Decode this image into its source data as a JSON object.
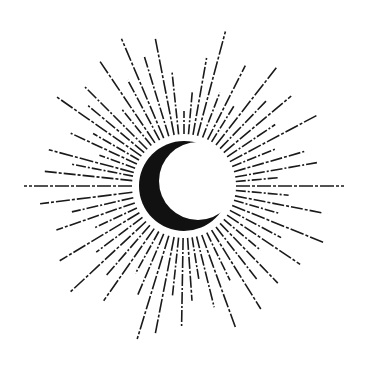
{
  "illustration": {
    "subject": "crescent moon with radiating dashed sunburst rays",
    "colors": {
      "background": "#ffffff",
      "ink": "#1a1a1a",
      "moon": "#111111"
    },
    "center": [
      184,
      186
    ],
    "moon": {
      "outer": {
        "cx": 184,
        "cy": 186,
        "r": 45
      },
      "inner": {
        "cx": 198,
        "cy": 181,
        "r": 39
      }
    },
    "rays": [
      {
        "a": 180,
        "r0": 52,
        "r1": 160,
        "d": "14 2 3 2"
      },
      {
        "a": 174,
        "r0": 52,
        "r1": 140,
        "d": "12 2 3 2"
      },
      {
        "a": 169,
        "r0": 52,
        "r1": 115,
        "d": "10 2 2 2"
      },
      {
        "a": 165,
        "r0": 52,
        "r1": 140,
        "d": "14 2 3 2"
      },
      {
        "a": 160,
        "r0": 52,
        "r1": 90,
        "d": "10 2 2 2"
      },
      {
        "a": 155,
        "r0": 52,
        "r1": 125,
        "d": "12 2 3 2"
      },
      {
        "a": 150,
        "r0": 52,
        "r1": 105,
        "d": "10 2 2 2"
      },
      {
        "a": 145,
        "r0": 52,
        "r1": 155,
        "d": "14 2 3 2"
      },
      {
        "a": 140,
        "r0": 52,
        "r1": 125,
        "d": "12 2 3 2"
      },
      {
        "a": 135,
        "r0": 52,
        "r1": 140,
        "d": "12 2 2 2"
      },
      {
        "a": 129,
        "r0": 52,
        "r1": 100,
        "d": "10 2 2 2"
      },
      {
        "a": 124,
        "r0": 52,
        "r1": 150,
        "d": "14 2 3 2"
      },
      {
        "a": 118,
        "r0": 52,
        "r1": 120,
        "d": "12 2 2 2"
      },
      {
        "a": 113,
        "r0": 52,
        "r1": 160,
        "d": "14 2 3 2"
      },
      {
        "a": 107,
        "r0": 52,
        "r1": 135,
        "d": "12 2 2 2"
      },
      {
        "a": 101,
        "r0": 52,
        "r1": 150,
        "d": "14 2 3 2"
      },
      {
        "a": 96,
        "r0": 52,
        "r1": 115,
        "d": "10 2 2 2"
      },
      {
        "a": 90,
        "r0": 52,
        "r1": 75,
        "d": "10 2 2 2"
      },
      {
        "a": 85,
        "r0": 52,
        "r1": 95,
        "d": "10 2 2 2"
      },
      {
        "a": 80,
        "r0": 52,
        "r1": 130,
        "d": "12 2 3 2"
      },
      {
        "a": 75,
        "r0": 52,
        "r1": 160,
        "d": "14 2 3 2"
      },
      {
        "a": 69,
        "r0": 52,
        "r1": 100,
        "d": "10 2 2 2"
      },
      {
        "a": 63,
        "r0": 52,
        "r1": 135,
        "d": "12 2 3 2"
      },
      {
        "a": 58,
        "r0": 52,
        "r1": 95,
        "d": "10 2 2 2"
      },
      {
        "a": 52,
        "r0": 52,
        "r1": 150,
        "d": "14 2 3 2"
      },
      {
        "a": 46,
        "r0": 52,
        "r1": 120,
        "d": "12 2 2 2"
      },
      {
        "a": 40,
        "r0": 52,
        "r1": 140,
        "d": "14 2 3 2"
      },
      {
        "a": 34,
        "r0": 52,
        "r1": 110,
        "d": "12 2 2 2"
      },
      {
        "a": 28,
        "r0": 52,
        "r1": 150,
        "d": "14 2 3 2"
      },
      {
        "a": 22,
        "r0": 52,
        "r1": 100,
        "d": "10 2 2 2"
      },
      {
        "a": 16,
        "r0": 52,
        "r1": 125,
        "d": "12 2 3 2"
      },
      {
        "a": 10,
        "r0": 52,
        "r1": 135,
        "d": "12 2 2 2"
      },
      {
        "a": 5,
        "r0": 52,
        "r1": 95,
        "d": "10 2 2 2"
      },
      {
        "a": 0,
        "r0": 52,
        "r1": 160,
        "d": "14 2 3 2"
      },
      {
        "a": -5,
        "r0": 52,
        "r1": 105,
        "d": "10 2 2 2"
      },
      {
        "a": -11,
        "r0": 52,
        "r1": 140,
        "d": "12 2 3 2"
      },
      {
        "a": -16,
        "r0": 52,
        "r1": 100,
        "d": "10 2 2 2"
      },
      {
        "a": -22,
        "r0": 52,
        "r1": 150,
        "d": "14 2 3 2"
      },
      {
        "a": -28,
        "r0": 52,
        "r1": 110,
        "d": "12 2 2 2"
      },
      {
        "a": -34,
        "r0": 52,
        "r1": 140,
        "d": "14 2 3 2"
      },
      {
        "a": -40,
        "r0": 52,
        "r1": 100,
        "d": "10 2 2 2"
      },
      {
        "a": -46,
        "r0": 52,
        "r1": 135,
        "d": "12 2 3 2"
      },
      {
        "a": -52,
        "r0": 52,
        "r1": 120,
        "d": "12 2 2 2"
      },
      {
        "a": -58,
        "r0": 52,
        "r1": 145,
        "d": "14 2 3 2"
      },
      {
        "a": -64,
        "r0": 52,
        "r1": 105,
        "d": "10 2 2 2"
      },
      {
        "a": -70,
        "r0": 52,
        "r1": 150,
        "d": "14 2 3 2"
      },
      {
        "a": -76,
        "r0": 52,
        "r1": 125,
        "d": "12 2 2 2"
      },
      {
        "a": -81,
        "r0": 52,
        "r1": 95,
        "d": "10 2 2 2"
      },
      {
        "a": -86,
        "r0": 52,
        "r1": 115,
        "d": "12 2 3 2"
      },
      {
        "a": -91,
        "r0": 52,
        "r1": 140,
        "d": "12 2 2 2"
      },
      {
        "a": -96,
        "r0": 52,
        "r1": 110,
        "d": "10 2 2 2"
      },
      {
        "a": -101,
        "r0": 52,
        "r1": 150,
        "d": "14 2 3 2"
      },
      {
        "a": -107,
        "r0": 52,
        "r1": 160,
        "d": "14 2 3 2"
      },
      {
        "a": -113,
        "r0": 52,
        "r1": 120,
        "d": "12 2 2 2"
      },
      {
        "a": -119,
        "r0": 52,
        "r1": 100,
        "d": "10 2 2 2"
      },
      {
        "a": -125,
        "r0": 52,
        "r1": 140,
        "d": "14 2 3 2"
      },
      {
        "a": -131,
        "r0": 52,
        "r1": 120,
        "d": "12 2 2 2"
      },
      {
        "a": -137,
        "r0": 52,
        "r1": 155,
        "d": "14 2 3 2"
      },
      {
        "a": -143,
        "r0": 52,
        "r1": 110,
        "d": "12 2 2 2"
      },
      {
        "a": -149,
        "r0": 52,
        "r1": 145,
        "d": "14 2 3 2"
      },
      {
        "a": -155,
        "r0": 52,
        "r1": 100,
        "d": "10 2 2 2"
      },
      {
        "a": -161,
        "r0": 52,
        "r1": 135,
        "d": "12 2 3 2"
      },
      {
        "a": -167,
        "r0": 52,
        "r1": 115,
        "d": "12 2 2 2"
      },
      {
        "a": -173,
        "r0": 52,
        "r1": 145,
        "d": "14 2 3 2"
      }
    ]
  }
}
